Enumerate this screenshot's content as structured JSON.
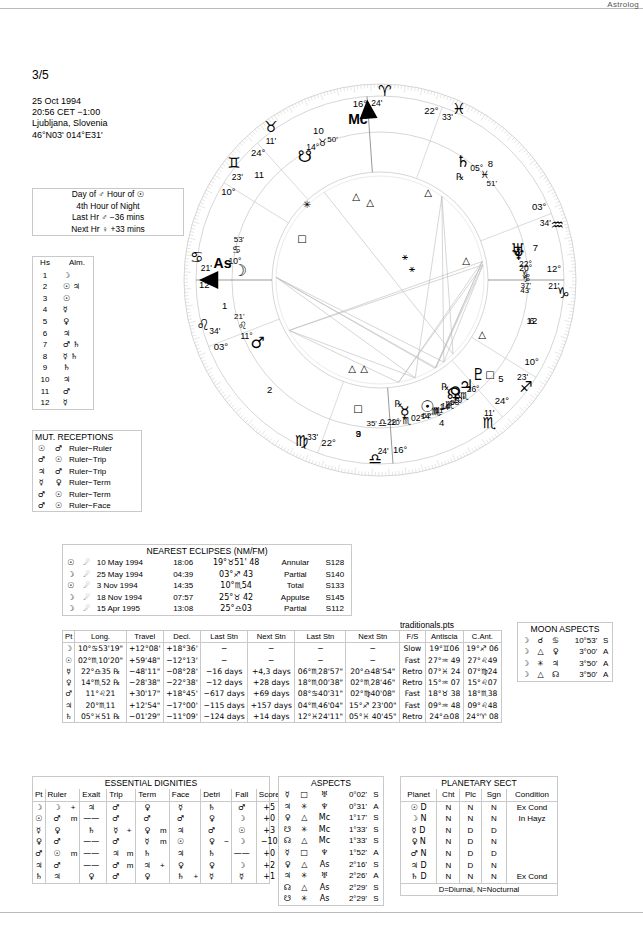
{
  "header": {
    "watermark": "Astrolog",
    "page_number": "3/5",
    "birth": [
      "25 Oct 1994",
      "20:56  CET −1:00",
      "Ljubljana, Slovenia",
      "46°N03' 014°E31'"
    ]
  },
  "hour_box": {
    "rows": [
      "Day of ♂  Hour of ☉",
      "4th Hour of Night",
      "Last Hr ♂ −36 mins",
      "Next Hr ♀ +33 mins"
    ]
  },
  "almuten": {
    "headers": [
      "Hs",
      "Alm."
    ],
    "rows": [
      [
        "1",
        "☽"
      ],
      [
        "2",
        "☉ ♃"
      ],
      [
        "3",
        "☉"
      ],
      [
        "4",
        "☿"
      ],
      [
        "5",
        "♀"
      ],
      [
        "6",
        "♃"
      ],
      [
        "7",
        "♂ ♄"
      ],
      [
        "8",
        "☿ ♄"
      ],
      [
        "9",
        "♄"
      ],
      [
        "10",
        "♃"
      ],
      [
        "11",
        "♂"
      ],
      [
        "12",
        "☿"
      ]
    ]
  },
  "mutual_receptions": {
    "title": "MUT. RECEPTIONS",
    "rows": [
      [
        "☉",
        "♂",
        "Ruler−Ruler"
      ],
      [
        "♂",
        "☉",
        "Ruler−Trip"
      ],
      [
        "♃",
        "♂",
        "Ruler−Trip"
      ],
      [
        "☿",
        "♀",
        "Ruler−Term"
      ],
      [
        "♂",
        "☉",
        "Ruler−Term"
      ],
      [
        "♂",
        "☉",
        "Ruler−Face"
      ]
    ]
  },
  "eclipses": {
    "title": "NEAREST ECLIPSES (NM/FM)",
    "rows": [
      [
        "☉",
        "☄",
        "10 May 1994",
        "18:06",
        "19°♉51' 48",
        "Annular",
        "S128"
      ],
      [
        "☽",
        "☄",
        "25 May 1994",
        "04:39",
        "03°♐ 43",
        "Partial",
        "S140"
      ],
      [
        "☉",
        "☄",
        "3 Nov 1994",
        "14:35",
        "10°♏54",
        "Total",
        "S133"
      ],
      [
        "☽",
        "☄",
        "18 Nov 1994",
        "07:57",
        "25°♉ 42",
        "Appulse",
        "S145"
      ],
      [
        "☽",
        "☄",
        "15 Apr 1995",
        "13:08",
        "25°♎03",
        "Partial",
        "S112"
      ]
    ]
  },
  "traditionals": {
    "file_label": "traditionals.pts",
    "headers": [
      "Pt",
      "Long.",
      "Travel",
      "Decl.",
      "Last Stn",
      "Next Stn",
      "Last Stn",
      "Next Stn",
      "F/S",
      "Antiscia",
      "C.Ant."
    ],
    "rows": [
      [
        "☽",
        "10°♋53'19\"",
        "+12°08'",
        "+18°36'",
        "−",
        "−",
        "−",
        "−",
        "Slow",
        "19°♊06",
        "19°♐ 06"
      ],
      [
        "☉",
        "02°♏10'20\"",
        "+59'48\"",
        "−12°13'",
        "−",
        "−",
        "−",
        "−",
        "Fast",
        "27°♒ 49",
        "27°♌49"
      ],
      [
        "☿",
        "22°♎35 ℞",
        "−48'11\"",
        "−08°28'",
        "−16 days",
        "+4,3 days",
        "06°♏28'57\"",
        "20°♎48'54\"",
        "Retro",
        "07°♓ 24",
        "07°♍24"
      ],
      [
        "♀",
        "14°♏52 ℞",
        "−28'38\"",
        "−22°38'",
        "−12 days",
        "+28 days",
        "18°♏00'38\"",
        "02°♏28'46\"",
        "Retro",
        "15°♒ 07",
        "15°♌07"
      ],
      [
        "♂",
        "11°♌21",
        "+30'17\"",
        "+18°45'",
        "−617 days",
        "+69 days",
        "08°♋40'31\"",
        "02°♍40'08\"",
        "Fast",
        "18°♉ 38",
        "18°♏38"
      ],
      [
        "♃",
        "20°♏11",
        "+12'54\"",
        "−17°00'",
        "−115 days",
        "+157 days",
        "04°♏46'04\"",
        "15°♐ 23'00\"",
        "Fast",
        "09°♒ 48",
        "09°♌48"
      ],
      [
        "♄",
        "05°♓51 ℞",
        "−01'29\"",
        "−11°09'",
        "−124 days",
        "+14 days",
        "12°♓24'11\"",
        "05°♓ 40'45\"",
        "Retro",
        "24°♎08",
        "24°♈ 08"
      ]
    ]
  },
  "moon_aspects": {
    "title": "MOON ASPECTS",
    "rows": [
      [
        "☽",
        "☌",
        "♋",
        "10°53'",
        "S"
      ],
      [
        "☽",
        "△",
        "♀",
        "3°00'",
        "A"
      ],
      [
        "☽",
        "✳",
        "♃",
        "3°50'",
        "A"
      ],
      [
        "☽",
        "△",
        "☊",
        "3°50'",
        "A"
      ]
    ]
  },
  "essential_dignities": {
    "title": "ESSENTIAL DIGNITIES",
    "headers": [
      "Pt",
      "Ruler",
      "Exalt",
      "Trip",
      "Term",
      "Face",
      "Detri",
      "Fall",
      "Score"
    ],
    "rows": [
      {
        "pt": "☽",
        "ruler": "☽",
        "ruler_m": "+",
        "exalt": "♃",
        "trip": "♂",
        "trip_m": "",
        "term": "♀",
        "term_m": "",
        "face": "☿",
        "face_m": "",
        "detri": "♄",
        "fall": "♂",
        "score": "+5",
        "score_p": ""
      },
      {
        "pt": "☉",
        "ruler": "♂",
        "ruler_m": "m",
        "exalt": "——",
        "trip": "♂",
        "trip_m": "",
        "term": "♂",
        "term_m": "",
        "face": "♂",
        "face_m": "",
        "detri": "♀",
        "fall": "☽",
        "score": "+0",
        "score_p": "p"
      },
      {
        "pt": "☿",
        "ruler": "♀",
        "ruler_m": "",
        "exalt": "♄",
        "trip": "☿",
        "trip_m": "+",
        "term": "♀",
        "term_m": "m",
        "face": "♃",
        "face_m": "",
        "detri": "♂",
        "fall": "☉",
        "score": "+3",
        "score_p": ""
      },
      {
        "pt": "♀",
        "ruler": "♂",
        "ruler_m": "",
        "exalt": "——",
        "trip": "♂",
        "trip_m": "",
        "term": "☿",
        "term_m": "m",
        "face": "☉",
        "face_m": "",
        "detri": "♀",
        "detri_m": "−",
        "fall": "☽",
        "score": "−10",
        "score_p": "p"
      },
      {
        "pt": "♂",
        "ruler": "☉",
        "ruler_m": "m",
        "exalt": "——",
        "trip": "♃",
        "trip_m": "m",
        "term": "♄",
        "term_m": "",
        "face": "♃",
        "face_m": "",
        "detri": "♄",
        "fall": "——",
        "score": "+0",
        "score_p": "p"
      },
      {
        "pt": "♃",
        "ruler": "♂",
        "ruler_m": "",
        "exalt": "——",
        "trip": "♂",
        "trip_m": "m",
        "term": "♃",
        "term_m": "+",
        "face": "♀",
        "face_m": "",
        "detri": "♀",
        "fall": "☽",
        "score": "+2",
        "score_p": ""
      },
      {
        "pt": "♄",
        "ruler": "♃",
        "ruler_m": "",
        "exalt": "♀",
        "trip": "♂",
        "trip_m": "",
        "term": "♀",
        "term_m": "",
        "face": "♄",
        "face_m": "+",
        "detri": "☿",
        "fall": "☿",
        "score": "+1",
        "score_p": ""
      }
    ]
  },
  "aspects": {
    "title": "ASPECTS",
    "rows": [
      [
        "☿",
        "□",
        "♅",
        "0°02'",
        "S"
      ],
      [
        "♃",
        "✳",
        "♆",
        "0°31'",
        "A"
      ],
      [
        "♀",
        "△",
        "Mc",
        "1°17'",
        "S"
      ],
      [
        "☋",
        "✳",
        "Mc",
        "1°33'",
        "S"
      ],
      [
        "☊",
        "△",
        "Mc",
        "1°33'",
        "S"
      ],
      [
        "☿",
        "□",
        "♆",
        "1°52'",
        "A"
      ],
      [
        "♀",
        "△",
        "As",
        "2°16'",
        "S"
      ],
      [
        "♃",
        "✳",
        "♅",
        "2°26'",
        "A"
      ],
      [
        "☊",
        "△",
        "As",
        "2°29'",
        "S"
      ],
      [
        "☋",
        "✳",
        "As",
        "2°29'",
        "S"
      ]
    ]
  },
  "planetary_sect": {
    "title": "PLANETARY SECT",
    "headers": [
      "Planet",
      "Cht",
      "Plc",
      "Sgn",
      "Condition"
    ],
    "rows": [
      [
        "☉",
        "D",
        "N",
        "N",
        "N",
        "Ex Cond"
      ],
      [
        "☽",
        "N",
        "N",
        "N",
        "N",
        "In Hayz"
      ],
      [
        "☿",
        "D",
        "N",
        "D",
        "D",
        ""
      ],
      [
        "♀",
        "N",
        "N",
        "D",
        "N",
        ""
      ],
      [
        "♂",
        "N",
        "N",
        "D",
        "D",
        ""
      ],
      [
        "♃",
        "D",
        "N",
        "D",
        "N",
        ""
      ],
      [
        "♄",
        "D",
        "N",
        "N",
        "N",
        "Ex Cond"
      ]
    ],
    "footer": "D=Diurnal, N=Nocturnal"
  },
  "wheel": {
    "cusps": [
      {
        "house": "1",
        "sign": "♋",
        "deg": "12°",
        "min": "21'",
        "label": "As"
      },
      {
        "house": "2",
        "sign": "♌",
        "deg": "03°",
        "min": "34'"
      },
      {
        "house": "3",
        "sign": "♍",
        "deg": "22°",
        "min": "33'"
      },
      {
        "house": "4",
        "sign": "♎",
        "deg": "16°",
        "min": "24'"
      },
      {
        "house": "5",
        "sign": "♏",
        "deg": "24°",
        "min": "11'"
      },
      {
        "house": "6",
        "sign": "♐",
        "deg": "10°",
        "min": "23'"
      },
      {
        "house": "7",
        "sign": "♑",
        "deg": "12°",
        "min": "21'"
      },
      {
        "house": "8",
        "sign": "♒",
        "deg": "03°",
        "min": "34'"
      },
      {
        "house": "9",
        "sign": "♓",
        "deg": "22°",
        "min": "33'"
      },
      {
        "house": "10",
        "sign": "♈",
        "deg": "16°",
        "min": "24'",
        "label": "Mc"
      },
      {
        "house": "11",
        "sign": "♉",
        "deg": "24°",
        "min": "11'"
      },
      {
        "house": "12",
        "sign": "♊",
        "deg": "10°",
        "min": "23'"
      }
    ],
    "planets": [
      {
        "name": "moon",
        "glyph": "☽",
        "deg": "10°",
        "sign": "♋",
        "min": "53'"
      },
      {
        "name": "sun",
        "glyph": "☉",
        "deg": "02°",
        "sign": "♏",
        "min": "10'"
      },
      {
        "name": "mercury",
        "glyph": "☿",
        "deg": "22°",
        "sign": "♎",
        "min": "35'",
        "retro": "℞"
      },
      {
        "name": "venus",
        "glyph": "♀",
        "deg": "14°",
        "sign": "♏",
        "min": "52'",
        "retro": "℞"
      },
      {
        "name": "mars",
        "glyph": "♂",
        "deg": "11°",
        "sign": "♌",
        "min": "21'"
      },
      {
        "name": "jupiter",
        "glyph": "♃",
        "deg": "20°",
        "sign": "♏",
        "min": "11'"
      },
      {
        "name": "saturn",
        "glyph": "♄",
        "deg": "05°",
        "sign": "♓",
        "min": "51'",
        "retro": "℞"
      },
      {
        "name": "uranus",
        "glyph": "♅",
        "deg": "22°",
        "sign": "♑",
        "min": "37'"
      },
      {
        "name": "neptune",
        "glyph": "♆",
        "deg": "20°",
        "sign": "♑",
        "min": "43'"
      },
      {
        "name": "pluto",
        "glyph": "♇",
        "deg": "26°",
        "sign": "♏",
        "min": "58'"
      },
      {
        "name": "north-node",
        "glyph": "☊",
        "deg": "14°",
        "sign": "♏",
        "min": "14'"
      },
      {
        "name": "south-node",
        "glyph": "☋",
        "deg": "14°",
        "sign": "♉",
        "min": "50'"
      }
    ],
    "house_numbers": [
      "1",
      "2",
      "3",
      "4",
      "5",
      "6",
      "7",
      "8",
      "9",
      "10",
      "11",
      "12"
    ]
  }
}
